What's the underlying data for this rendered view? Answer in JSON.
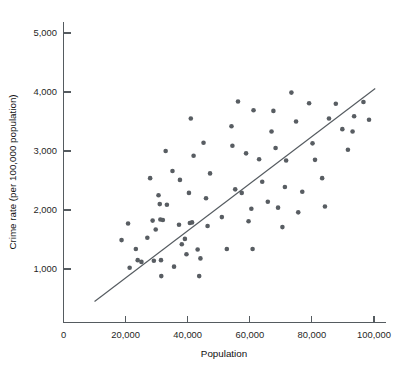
{
  "chart_data": {
    "type": "scatter",
    "title": "",
    "xlabel": "Population",
    "ylabel": "Crime rate (per 100,000 population)",
    "xlim": [
      0,
      107000
    ],
    "ylim": [
      0,
      5400
    ],
    "grid": false,
    "legend": "none",
    "x_ticks": [
      0,
      20000,
      40000,
      60000,
      80000,
      100000
    ],
    "x_tick_labels": [
      "0",
      "20,000",
      "40,000",
      "60,000",
      "80,000",
      "100,000"
    ],
    "y_ticks": [
      1000,
      2000,
      3000,
      4000,
      5000
    ],
    "y_tick_labels": [
      "1,000",
      "2,000",
      "3,000",
      "4,000",
      "5,000"
    ],
    "series": [
      {
        "name": "Cities",
        "marker": "filled-circle",
        "marker_color": "#585d62",
        "marker_size": 4.6,
        "points": [
          [
            18700,
            1490
          ],
          [
            20800,
            1770
          ],
          [
            21300,
            1020
          ],
          [
            23300,
            1340
          ],
          [
            23900,
            1150
          ],
          [
            25100,
            1120
          ],
          [
            27000,
            1530
          ],
          [
            27900,
            2540
          ],
          [
            28700,
            1820
          ],
          [
            29100,
            1140
          ],
          [
            29700,
            1670
          ],
          [
            30600,
            2250
          ],
          [
            31000,
            2100
          ],
          [
            31200,
            1840
          ],
          [
            31400,
            1150
          ],
          [
            31500,
            880
          ],
          [
            32000,
            1830
          ],
          [
            32900,
            3000
          ],
          [
            33300,
            2090
          ],
          [
            35100,
            2660
          ],
          [
            35600,
            1040
          ],
          [
            37200,
            1750
          ],
          [
            37500,
            2510
          ],
          [
            38100,
            1420
          ],
          [
            39100,
            1510
          ],
          [
            39600,
            1250
          ],
          [
            40400,
            2290
          ],
          [
            40700,
            1780
          ],
          [
            41000,
            3550
          ],
          [
            41400,
            1790
          ],
          [
            41900,
            2920
          ],
          [
            43200,
            1330
          ],
          [
            43700,
            880
          ],
          [
            44100,
            1180
          ],
          [
            45100,
            3140
          ],
          [
            45900,
            2200
          ],
          [
            46400,
            1730
          ],
          [
            47200,
            2620
          ],
          [
            51000,
            1880
          ],
          [
            52600,
            1340
          ],
          [
            54100,
            3420
          ],
          [
            54400,
            3090
          ],
          [
            55300,
            2350
          ],
          [
            56200,
            3840
          ],
          [
            57400,
            2290
          ],
          [
            58800,
            2960
          ],
          [
            59600,
            1810
          ],
          [
            60500,
            2020
          ],
          [
            60900,
            1340
          ],
          [
            61200,
            3690
          ],
          [
            63000,
            2860
          ],
          [
            64000,
            2480
          ],
          [
            65800,
            2140
          ],
          [
            67000,
            3330
          ],
          [
            67600,
            3680
          ],
          [
            68300,
            3050
          ],
          [
            69100,
            2040
          ],
          [
            70500,
            1710
          ],
          [
            71300,
            2390
          ],
          [
            71700,
            2840
          ],
          [
            73400,
            3990
          ],
          [
            74900,
            3500
          ],
          [
            75600,
            1960
          ],
          [
            76900,
            2310
          ],
          [
            79100,
            3810
          ],
          [
            80200,
            3130
          ],
          [
            81000,
            2850
          ],
          [
            83300,
            2540
          ],
          [
            84200,
            2060
          ],
          [
            85500,
            3550
          ],
          [
            87700,
            3800
          ],
          [
            89800,
            3370
          ],
          [
            91600,
            3020
          ],
          [
            93100,
            3330
          ],
          [
            93600,
            3590
          ],
          [
            96600,
            3830
          ],
          [
            98400,
            3530
          ]
        ]
      }
    ],
    "trend_line": {
      "label": "least-squares regression line",
      "color": "#555b60",
      "x_start": 10000,
      "y_start": 450,
      "x_end": 100400,
      "y_end": 4060
    }
  },
  "axis": {
    "y_axis_label": "Crime rate (per 100,000 population)",
    "x_axis_label": "Population"
  }
}
